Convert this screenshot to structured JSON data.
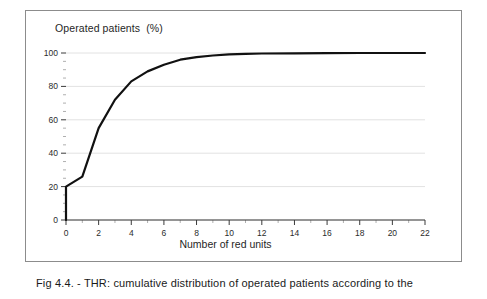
{
  "figure": {
    "caption": "Fig 4.4. - THR: cumulative distribution of operated patients according to the"
  },
  "chart_data": {
    "type": "line",
    "title": "Operated patients  (%)",
    "xlabel": "Number of red units",
    "ylabel": "Operated patients (%)",
    "xlim": [
      0,
      22
    ],
    "ylim": [
      0,
      100
    ],
    "xticks": [
      0,
      2,
      4,
      6,
      8,
      10,
      12,
      14,
      16,
      18,
      20,
      22
    ],
    "xtick_labels": [
      "0",
      "2",
      "4",
      "6",
      "8",
      "10",
      "12",
      "14",
      "16",
      "18",
      "20",
      "22"
    ],
    "yticks": [
      0,
      20,
      40,
      60,
      80,
      100
    ],
    "ytick_labels": [
      "0",
      "20",
      "40",
      "60",
      "80",
      "100"
    ],
    "minor_ytick_step": 5,
    "minor_xtick_step": 1,
    "grid": true,
    "grid_axis": "y",
    "grid_color": "#e2e2e2",
    "legend": false,
    "line_color": "#111111",
    "line_width": 2.2,
    "series": [
      {
        "name": "Cumulative % of operated patients",
        "x": [
          0,
          0,
          1,
          2,
          3,
          4,
          5,
          6,
          7,
          8,
          9,
          10,
          11,
          12,
          14,
          16,
          18,
          20,
          22
        ],
        "values": [
          0,
          20,
          26,
          55,
          72,
          83,
          89,
          93,
          96,
          97.5,
          98.5,
          99.2,
          99.5,
          99.7,
          99.8,
          99.9,
          100,
          100,
          100
        ]
      }
    ],
    "annotations": []
  },
  "axes": {
    "axis_color": "#3a3a3a",
    "frame_color": "#8c8c8c"
  }
}
